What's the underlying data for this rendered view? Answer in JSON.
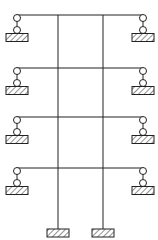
{
  "diagram": {
    "type": "structural-frame",
    "line_color": "#222222",
    "hatch_color": "#333333",
    "columns_x": [
      58,
      103
    ],
    "column_top_y": 15,
    "column_base_y": 229,
    "beam_left_x": 17,
    "beam_right_x": 143,
    "floors_y": [
      15,
      68,
      117,
      168
    ],
    "link_length": 15,
    "hinge_radius": 3.5,
    "support_width": 22,
    "support_height": 8,
    "base_supports": [
      {
        "x": 58,
        "y": 229
      },
      {
        "x": 103,
        "y": 229
      }
    ]
  }
}
